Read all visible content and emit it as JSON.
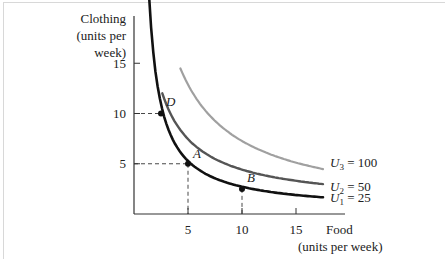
{
  "chart_data": {
    "type": "line",
    "title": "",
    "xlabel": "Food (units per week)",
    "ylabel": "Clothing (units per week)",
    "xlabel_lines": [
      "Food",
      "(units per week)"
    ],
    "ylabel_lines": [
      "Clothing",
      "(units per",
      "week)"
    ],
    "xlim": [
      0,
      20
    ],
    "ylim": [
      0,
      17.5
    ],
    "xticks": [
      5,
      10,
      15
    ],
    "yticks": [
      5,
      10,
      15
    ],
    "xtick_labels": [
      "5",
      "10",
      "15"
    ],
    "ytick_labels": [
      "5",
      "10",
      "15"
    ],
    "grid": false,
    "legend_position": "right, inline labels at curve ends",
    "series": [
      {
        "name": "U1 = 25",
        "label_base": "U",
        "label_sub": "1",
        "label_value": " = 25",
        "color": "#111111",
        "x": [
          1.4,
          2.5,
          5,
          10,
          17.5
        ],
        "y": [
          17.5,
          10,
          5,
          2.5,
          1.6
        ]
      },
      {
        "name": "U2 = 50",
        "label_base": "U",
        "label_sub": "2",
        "label_value": " = 50",
        "color": "#555555",
        "x": [
          2.6,
          5,
          10,
          17.5
        ],
        "y": [
          17.5,
          10,
          5,
          2.8
        ]
      },
      {
        "name": "U3 = 100",
        "label_base": "U",
        "label_sub": "3",
        "label_value": " = 100",
        "color": "#a0a0a0",
        "x": [
          4.3,
          7,
          10,
          14,
          17.5
        ],
        "y": [
          17.5,
          12.5,
          9,
          7,
          5.2
        ]
      }
    ],
    "points": [
      {
        "label": "D",
        "x": 2.5,
        "y": 10
      },
      {
        "label": "A",
        "x": 5,
        "y": 5
      },
      {
        "label": "B",
        "x": 10,
        "y": 2.5
      }
    ],
    "annotations": [
      "Dashed guide lines from D to y=10, from A to x=5 and y=5, from B to x=10"
    ]
  }
}
